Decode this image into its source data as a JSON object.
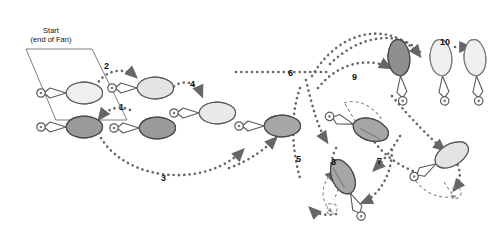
{
  "figure": {
    "type": "motion-sequence-diagram",
    "title_annotation": {
      "line1": "Start",
      "line2": "(end of Fan)",
      "x": 50,
      "y": 32
    },
    "background_color": "#ffffff",
    "stroke_color": "#555555",
    "label_color": "#111111",
    "fills": {
      "light": "#efefef",
      "mid": "#d9d9d9",
      "dark": "#9a9a9a",
      "darker": "#8f8f8f",
      "outline": "#5a5a5a"
    }
  },
  "step_labels": [
    {
      "id": "step-1",
      "text": "1",
      "x": 119,
      "y": 103
    },
    {
      "id": "step-2",
      "text": "2",
      "x": 104,
      "y": 62
    },
    {
      "id": "step-3",
      "text": "3",
      "x": 161,
      "y": 174
    },
    {
      "id": "step-4",
      "text": "4",
      "x": 190,
      "y": 80
    },
    {
      "id": "step-5",
      "text": "5",
      "x": 296,
      "y": 155
    },
    {
      "id": "step-6",
      "text": "6",
      "x": 288,
      "y": 69
    },
    {
      "id": "step-7",
      "text": "7",
      "x": 377,
      "y": 157
    },
    {
      "id": "step-8",
      "text": "8",
      "x": 331,
      "y": 158
    },
    {
      "id": "step-9",
      "text": "9",
      "x": 352,
      "y": 73
    },
    {
      "id": "step-10",
      "text": "10",
      "x": 440,
      "y": 38
    }
  ],
  "rackets": [
    {
      "id": "racket-start",
      "cx": 72,
      "cy": 93,
      "angle": 0,
      "fill": "light",
      "scale": 1.0
    },
    {
      "id": "racket-pos-2",
      "cx": 143,
      "cy": 88,
      "angle": 0,
      "fill": "light",
      "scale": 1.0
    },
    {
      "id": "racket-pos-1a",
      "cx": 72,
      "cy": 127,
      "angle": 0,
      "fill": "dark",
      "scale": 1.0
    },
    {
      "id": "racket-pos-1b",
      "cx": 145,
      "cy": 128,
      "angle": 0,
      "fill": "dark",
      "scale": 1.0
    },
    {
      "id": "racket-pos-4",
      "cx": 205,
      "cy": 113,
      "angle": 0,
      "fill": "light",
      "scale": 1.0
    },
    {
      "id": "racket-pos-5",
      "cx": 270,
      "cy": 126,
      "angle": 0,
      "fill": "dark",
      "scale": 1.0
    },
    {
      "id": "racket-pos-8-rot",
      "cx": 359,
      "cy": 126,
      "angle": 18,
      "fill": "dark",
      "scale": 1.0
    },
    {
      "id": "racket-pos-8-vert",
      "cx": 348,
      "cy": 188,
      "angle": -115,
      "fill": "dark",
      "scale": 1.0
    },
    {
      "id": "racket-pos-7",
      "cx": 441,
      "cy": 161,
      "angle": -30,
      "fill": "light",
      "scale": 1.0
    },
    {
      "id": "racket-pos-9",
      "cx": 400,
      "cy": 70,
      "angle": -95,
      "fill": "darker",
      "scale": 1.0
    },
    {
      "id": "racket-pos-10a",
      "cx": 442,
      "cy": 70,
      "angle": -95,
      "fill": "light",
      "scale": 1.0
    },
    {
      "id": "racket-pos-10b",
      "cx": 476,
      "cy": 70,
      "angle": -95,
      "fill": "light",
      "scale": 1.0
    }
  ],
  "paths": [
    {
      "id": "path-1",
      "kind": "dotted-arrow"
    },
    {
      "id": "path-2",
      "kind": "dotted-arrow"
    },
    {
      "id": "path-3",
      "kind": "dotted-arrow"
    },
    {
      "id": "path-4",
      "kind": "dotted-arrow"
    },
    {
      "id": "path-5",
      "kind": "dotted-arrow"
    },
    {
      "id": "path-6",
      "kind": "dotted-arrow"
    },
    {
      "id": "path-7",
      "kind": "dotted-arrow"
    },
    {
      "id": "path-8",
      "kind": "dotted-arrow"
    },
    {
      "id": "path-9",
      "kind": "dotted-arrow"
    },
    {
      "id": "path-10",
      "kind": "dotted-arrow"
    },
    {
      "id": "rotation-guide-a",
      "kind": "dashed-arc"
    },
    {
      "id": "rotation-guide-b",
      "kind": "dashed-arc"
    },
    {
      "id": "rotation-guide-c",
      "kind": "dashed-arc"
    }
  ]
}
